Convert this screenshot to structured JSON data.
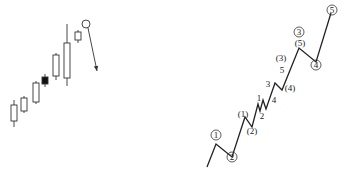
{
  "candlestick_panel": {
    "stroke_color": "#333333",
    "candles": [
      {
        "x": 14,
        "high": 100,
        "top": 105,
        "bottom": 121,
        "low": 127,
        "filled": false
      },
      {
        "x": 24,
        "high": 96,
        "top": 98,
        "bottom": 111,
        "low": 113,
        "filled": false
      },
      {
        "x": 36,
        "high": 81,
        "top": 83,
        "bottom": 102,
        "low": 104,
        "filled": false
      },
      {
        "x": 45,
        "high": 74,
        "top": 77,
        "bottom": 84,
        "low": 87,
        "filled": true
      },
      {
        "x": 56,
        "high": 53,
        "top": 55,
        "bottom": 76,
        "low": 80,
        "filled": false
      },
      {
        "x": 67,
        "high": 24,
        "top": 43,
        "bottom": 78,
        "low": 86,
        "filled": false
      },
      {
        "x": 78,
        "high": 30,
        "top": 32,
        "bottom": 40,
        "low": 43,
        "filled": false
      }
    ],
    "peak_marker": {
      "cx": 86,
      "cy": 24,
      "r": 4
    },
    "arrow": {
      "x1": 88,
      "y1": 28,
      "x2": 97,
      "y2": 71
    }
  },
  "wave_panel": {
    "stroke_color": "#222222",
    "path_points": [
      [
        207,
        167
      ],
      [
        216,
        144
      ],
      [
        232,
        157
      ],
      [
        245,
        117
      ],
      [
        252,
        127
      ],
      [
        258,
        104
      ],
      [
        260,
        111
      ],
      [
        263,
        100
      ],
      [
        266,
        109
      ],
      [
        275,
        83
      ],
      [
        282,
        90
      ],
      [
        299,
        48
      ],
      [
        316,
        62
      ],
      [
        331,
        13
      ]
    ],
    "labels": [
      {
        "text": "1",
        "x": 216,
        "y": 135,
        "circled": true
      },
      {
        "text": "2",
        "x": 232,
        "y": 157,
        "circled": true
      },
      {
        "text": "(1)",
        "x": 243,
        "y": 114,
        "circled": false
      },
      {
        "text": "(2)",
        "x": 252,
        "y": 131,
        "circled": false
      },
      {
        "text": "1",
        "x": 259,
        "y": 98,
        "circled": false
      },
      {
        "text": "2",
        "x": 262,
        "y": 116,
        "circled": false
      },
      {
        "text": "3",
        "x": 268,
        "y": 84,
        "circled": false
      },
      {
        "text": "4",
        "x": 274,
        "y": 100,
        "circled": false
      },
      {
        "text": "5",
        "x": 282,
        "y": 70,
        "circled": false
      },
      {
        "text": "(3)",
        "x": 281,
        "y": 58,
        "circled": false
      },
      {
        "text": "(4)",
        "x": 290,
        "y": 88,
        "circled": false
      },
      {
        "text": "3",
        "x": 299,
        "y": 32,
        "circled": true
      },
      {
        "text": "(5)",
        "x": 300,
        "y": 43,
        "circled": false
      },
      {
        "text": "4",
        "x": 316,
        "y": 65,
        "circled": true
      },
      {
        "text": "5",
        "x": 332,
        "y": 10,
        "circled": true
      }
    ]
  }
}
